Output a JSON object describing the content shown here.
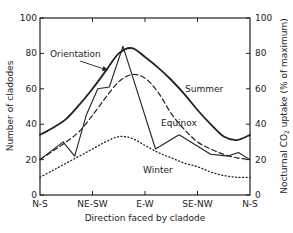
{
  "chart_data": {
    "type": "line",
    "title": "",
    "xlabel": "Direction faced by cladode",
    "ylabel": "Number of cladodes",
    "ylabel_right": "Nocturnal CO2 uptake (% of maximum)",
    "ylabel_right_parts": {
      "before": "Nocturnal CO",
      "sub": "2",
      "after": " uptake  (% of maximum)"
    },
    "categories": [
      "N-S",
      "NE-SW",
      "E-W",
      "SE-NW",
      "N-S"
    ],
    "ylim": [
      0,
      100
    ],
    "yticks_left": [
      0,
      20,
      40,
      60,
      80,
      100
    ],
    "yticks_right": [
      0,
      20,
      40,
      60,
      80,
      100
    ],
    "grid": false,
    "legend": "inline labels",
    "x_positions_note": "x in units of category index (0=N-S, 1=NE-SW, 2=E-W, 3=SE-NW, 4=N-S)",
    "series": [
      {
        "name": "Summer",
        "style": "solid-thick",
        "axis": "right",
        "x": [
          0,
          0.25,
          0.5,
          0.75,
          1.0,
          1.25,
          1.5,
          1.75,
          2.0,
          2.25,
          2.5,
          2.75,
          3.0,
          3.25,
          3.5,
          3.75,
          4.0
        ],
        "y": [
          34,
          38,
          43,
          51,
          60,
          70,
          80,
          83,
          78,
          72,
          65,
          57,
          48,
          40,
          33,
          31,
          34
        ]
      },
      {
        "name": "Equinox",
        "style": "dashed",
        "axis": "right",
        "x": [
          0,
          0.25,
          0.5,
          0.75,
          1.0,
          1.25,
          1.5,
          1.75,
          2.0,
          2.25,
          2.5,
          2.75,
          3.0,
          3.25,
          3.5,
          3.75,
          4.0
        ],
        "y": [
          20,
          25,
          30,
          36,
          45,
          55,
          64,
          68,
          66,
          58,
          46,
          37,
          30,
          26,
          23,
          21,
          20
        ]
      },
      {
        "name": "Winter",
        "style": "dotted",
        "axis": "right",
        "x": [
          0,
          0.25,
          0.5,
          0.75,
          1.0,
          1.25,
          1.5,
          1.75,
          2.0,
          2.25,
          2.5,
          2.75,
          3.0,
          3.25,
          3.5,
          3.75,
          4.0
        ],
        "y": [
          10,
          14,
          18,
          22,
          26,
          30,
          33,
          32,
          28,
          24,
          21,
          18,
          16,
          13,
          11,
          10,
          10
        ]
      },
      {
        "name": "Orientation",
        "style": "solid-thin",
        "axis": "left",
        "x": [
          0,
          0.44,
          0.66,
          0.88,
          1.1,
          1.32,
          1.58,
          2.2,
          2.65,
          3.25,
          3.58,
          3.78,
          4.0
        ],
        "y": [
          20,
          30,
          22,
          45,
          60,
          61,
          84,
          26,
          34,
          23,
          22,
          24,
          20
        ]
      }
    ],
    "annotations": [
      {
        "text": "Orientation",
        "arrow_to_series": "Orientation"
      },
      {
        "text": "Summer"
      },
      {
        "text": "Equinox"
      },
      {
        "text": "Winter"
      }
    ]
  }
}
